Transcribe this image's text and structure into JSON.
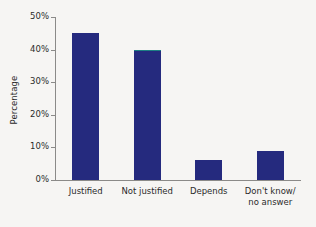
{
  "chart_data": {
    "type": "bar",
    "title": "",
    "subtitle": "",
    "xlabel": "",
    "ylabel": "Percentage",
    "categories": [
      "Justified",
      "Not justified",
      "Depends",
      "Don't know/\nno answer"
    ],
    "values": [
      45,
      40,
      6,
      9
    ],
    "ylim": [
      0,
      50
    ],
    "ytick_values": [
      0,
      10,
      20,
      30,
      40,
      50
    ],
    "ytick_labels": [
      "0%",
      "10%",
      "20%",
      "30%",
      "40%",
      "50%"
    ],
    "grid": false,
    "legend": null,
    "bar_color": "#252a7e",
    "background_color": "#f6f5f3",
    "axis_color": "#8b8a88",
    "text_color": "#2b2b2b",
    "annotations": []
  }
}
